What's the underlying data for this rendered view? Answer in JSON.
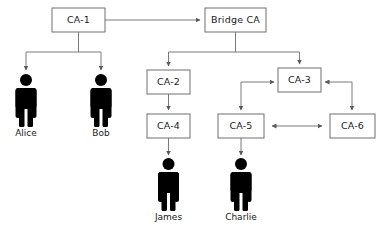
{
  "diagram": {
    "type": "bridge-ca-trust-hierarchy",
    "background_color": "#ffffff",
    "line_color": "#7a7a7a",
    "box_stroke_color": "#6e6e6e",
    "box_fill_color": "#ffffff",
    "person_color": "#000000",
    "text_color": "#1a1a1a",
    "nodes": {
      "ca1": {
        "label": "CA-1",
        "x": 52,
        "y": 8,
        "w": 53,
        "h": 24
      },
      "bridge": {
        "label": "Bridge CA",
        "x": 205,
        "y": 8,
        "w": 61,
        "h": 24
      },
      "ca2": {
        "label": "CA-2",
        "x": 147,
        "y": 70,
        "w": 43,
        "h": 24
      },
      "ca3": {
        "label": "CA-3",
        "x": 278,
        "y": 68,
        "w": 43,
        "h": 24
      },
      "ca4": {
        "label": "CA-4",
        "x": 147,
        "y": 114,
        "w": 43,
        "h": 24
      },
      "ca5": {
        "label": "CA-5",
        "x": 218,
        "y": 114,
        "w": 46,
        "h": 24
      },
      "ca6": {
        "label": "CA-6",
        "x": 330,
        "y": 114,
        "w": 45,
        "h": 24
      }
    },
    "people": [
      {
        "name": "Alice",
        "cx": 26,
        "top": 74,
        "label_y": 128
      },
      {
        "name": "Bob",
        "cx": 101,
        "top": 74,
        "label_y": 128
      },
      {
        "name": "James",
        "cx": 168,
        "top": 158,
        "label_y": 212
      },
      {
        "name": "Charlie",
        "cx": 241,
        "top": 158,
        "label_y": 212
      }
    ],
    "edges": [
      {
        "from": "CA-1",
        "to": "Bridge CA",
        "kind": "directed"
      },
      {
        "from": "CA-1",
        "to": "Alice",
        "kind": "directed"
      },
      {
        "from": "CA-1",
        "to": "Bob",
        "kind": "directed"
      },
      {
        "from": "Bridge CA",
        "to": "CA-2",
        "kind": "directed"
      },
      {
        "from": "Bridge CA",
        "to": "CA-3",
        "kind": "directed"
      },
      {
        "from": "CA-2",
        "to": "CA-4",
        "kind": "directed"
      },
      {
        "from": "CA-4",
        "to": "James",
        "kind": "directed"
      },
      {
        "from": "CA-3",
        "to": "CA-5",
        "kind": "cross-certified"
      },
      {
        "from": "CA-3",
        "to": "CA-6",
        "kind": "cross-certified"
      },
      {
        "from": "CA-5",
        "to": "CA-6",
        "kind": "bidirectional"
      },
      {
        "from": "CA-5",
        "to": "Charlie",
        "kind": "directed"
      }
    ]
  }
}
